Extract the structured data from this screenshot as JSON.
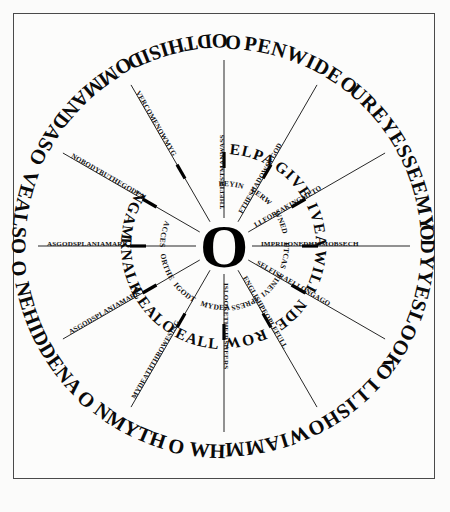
{
  "figure": {
    "type": "circular-text-wheel",
    "background_color": "#fbfbfa",
    "ink_color": "#0a0a0a",
    "border_color": "#4a4a4a",
    "hub_letter": "O",
    "spoke_count": 12
  },
  "outer_ring": {
    "description": "Large display capitals running clockwise around the outermost circle, beginning at the enlarged O at top.",
    "full_text": "OPENWIDEYOUREYESSEEMYBODYYESLOOKTOALLISHOWIAMMANIWHONMYTHRONEHIDDENABOVEALSOCOMMANDASGODTHISID",
    "segments": [
      {
        "id": "o1",
        "text": "OPENWIDEY",
        "lead_cap": "O"
      },
      {
        "id": "o2",
        "text": "OUREYESSEEMYB",
        "lead_cap": "O"
      },
      {
        "id": "o3",
        "text": "ODYYESLOOKT",
        "lead_cap": "O"
      },
      {
        "id": "o4",
        "text": "OALLISHOWIAMMAN",
        "lead_cap": "O"
      },
      {
        "id": "o5",
        "text": "IWH",
        "lead_cap": ""
      },
      {
        "id": "o6",
        "text": "ONMYTHR",
        "lead_cap": "O"
      },
      {
        "id": "o7",
        "text": "ONEHIDDENAB",
        "lead_cap": "O"
      },
      {
        "id": "o8",
        "text": "OVEALSOC",
        "lead_cap": "O"
      },
      {
        "id": "o9",
        "text": "OMMANDASG",
        "lead_cap": "O"
      },
      {
        "id": "o10",
        "text": "ODTHISID",
        "lead_cap": "O"
      }
    ],
    "rendered_sequence": "O PEN WIDE Y O UR EYES SEE MY B O DY YES LOOK T O ALL IS HOW I AM MAN I WH O N MY THR O NE HIDDEN AB O VE ALS O C O MMAND AS G O D THIS ID"
  },
  "inner_ring": {
    "description": "Medium display capitals on the inner circle, twelve spoke-separated words.",
    "words": [
      "HELPAS",
      "GIVE",
      "GIVEAS",
      "WILL",
      "CONDEMN",
      "CROWN",
      "IRULEALLAND",
      "RULEALONE",
      "ETERNALKING",
      "INGAMI"
    ],
    "rendered_sequence": "I NGAM I HELPAS I GIVE I GIVEAS I WILL I CONDEMN I CROWN I IRULEALLAND I RULEALONE I ETERNALKING"
  },
  "spokes": {
    "description": "Twelve radial spokes, each carrying small capitals running from the hub outward.",
    "items": [
      {
        "index": 1,
        "angle_deg": 270,
        "text": "THEFIRSTMANWASS"
      },
      {
        "index": 2,
        "angle_deg": 300,
        "text": "FTHESHADOWOFGOD"
      },
      {
        "index": 3,
        "angle_deg": 330,
        "text": "LLFORSAKINGMETO"
      },
      {
        "index": 4,
        "angle_deg": 0,
        "text": "IMPRISONEDHISMOBSECH"
      },
      {
        "index": 5,
        "angle_deg": 30,
        "text": "SELFISRAELLONGAGO"
      },
      {
        "index": 6,
        "angle_deg": 60,
        "text": "ENGLISHPEOPLEFULL"
      },
      {
        "index": 7,
        "angle_deg": 90,
        "text": "ISLOOKETHEIRSHEERS"
      },
      {
        "index": 8,
        "angle_deg": 120,
        "text": "MYDEATHTHROWESING"
      },
      {
        "index": 9,
        "angle_deg": 150,
        "text": "ASGODSPLANIAMARK"
      },
      {
        "index": 10,
        "angle_deg": 180,
        "text": "ASGODSPLANIAMARK"
      },
      {
        "index": 11,
        "angle_deg": 210,
        "text": "NOBODYBUTHEGODFA"
      },
      {
        "index": 12,
        "angle_deg": 240,
        "text": "VERCOMENOWMYG"
      }
    ]
  },
  "mid_arcs": {
    "description": "Small capitals running along the mid-radius arcs between inner ring and hub.",
    "items": [
      {
        "index": 1,
        "text": "BEYINGWOMANSW"
      },
      {
        "index": 2,
        "text": "VERWHELMEDMANIS"
      },
      {
        "index": 3,
        "text": "WNEDEVILARMSITOLLII"
      },
      {
        "index": 4,
        "text": "UTCASTHEKNEWEARTH"
      },
      {
        "index": 5,
        "text": "FINEVIRTUEARMAKEWHO"
      },
      {
        "index": 6,
        "text": "IPRESSEDMENTOREBELS"
      },
      {
        "index": 7,
        "text": "MYDEATHTHROWESING"
      },
      {
        "index": 8,
        "text": "IGODTHEHAVEHILGOD"
      },
      {
        "index": 9,
        "text": "ORTHEVIRTUEWED"
      },
      {
        "index": 10,
        "text": "ACCESSTANNIANTHUS"
      }
    ]
  },
  "hub": {
    "letter": "O",
    "note": "large bold O at the exact centre of the wheel"
  }
}
